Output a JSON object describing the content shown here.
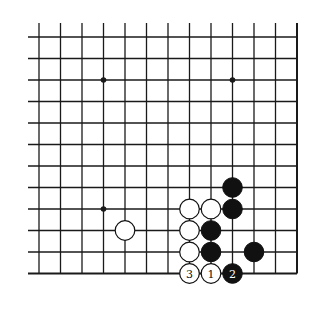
{
  "diagram": {
    "type": "go-board-partial",
    "view": "bottom-right corner",
    "columns": 13,
    "rows": 12,
    "open_edges": [
      "top",
      "left"
    ],
    "closed_edges": [
      "bottom",
      "right"
    ],
    "colors": {
      "line": "#1a1a1a",
      "black_stone": "#111111",
      "white_stone": "#ffffff",
      "background": "#ffffff"
    },
    "star_points": [
      {
        "col": 3,
        "row": 2
      },
      {
        "col": 9,
        "row": 2
      },
      {
        "col": 3,
        "row": 8
      }
    ],
    "stones": [
      {
        "color": "white",
        "col": 4,
        "row": 9,
        "label": ""
      },
      {
        "color": "black",
        "col": 9,
        "row": 7,
        "label": ""
      },
      {
        "color": "white",
        "col": 7,
        "row": 8,
        "label": ""
      },
      {
        "color": "white",
        "col": 8,
        "row": 8,
        "label": ""
      },
      {
        "color": "black",
        "col": 9,
        "row": 8,
        "label": ""
      },
      {
        "color": "white",
        "col": 7,
        "row": 9,
        "label": ""
      },
      {
        "color": "black",
        "col": 8,
        "row": 9,
        "label": ""
      },
      {
        "color": "white",
        "col": 7,
        "row": 10,
        "label": ""
      },
      {
        "color": "black",
        "col": 8,
        "row": 10,
        "label": ""
      },
      {
        "color": "black",
        "col": 10,
        "row": 10,
        "label": ""
      },
      {
        "color": "white",
        "col": 7,
        "row": 11,
        "label": "3"
      },
      {
        "color": "white",
        "col": 8,
        "row": 11,
        "label": "1"
      },
      {
        "color": "black",
        "col": 9,
        "row": 11,
        "label": "2"
      }
    ]
  }
}
